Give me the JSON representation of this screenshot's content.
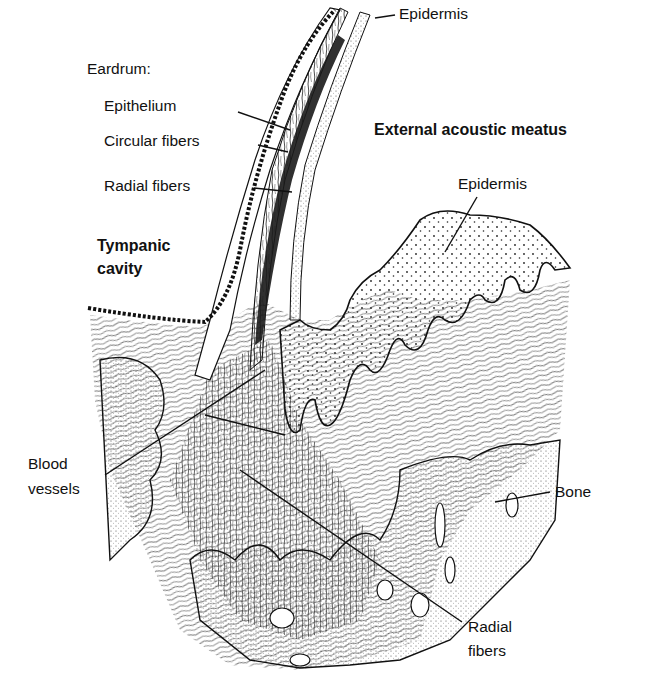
{
  "figure": {
    "colors": {
      "ink": "#111111",
      "background": "#ffffff"
    }
  },
  "labels": {
    "eardrum": "Eardrum:",
    "epithelium": "Epithelium",
    "circular_fibers": "Circular fibers",
    "radial_fibers_eardrum": "Radial fibers",
    "epidermis_top": "Epidermis",
    "external_acoustic_meatus": "External acoustic meatus",
    "epidermis_right": "Epidermis",
    "tympanic_cavity_line1": "Tympanic",
    "tympanic_cavity_line2": "cavity",
    "blood_vessels_line1": "Blood",
    "blood_vessels_line2": "vessels",
    "bone": "Bone",
    "radial_fibers_bottom_line1": "Radial",
    "radial_fibers_bottom_line2": "fibers"
  }
}
